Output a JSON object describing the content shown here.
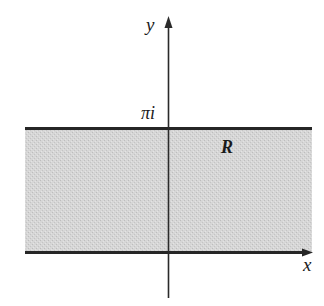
{
  "figure": {
    "type": "complex-plane-region"
  },
  "labels": {
    "y_axis": "y",
    "x_axis": "x",
    "top_boundary": "πi",
    "region": "R"
  },
  "colors": {
    "region_fill": "#d2d2d2",
    "boundary_line": "#262626",
    "axis_line": "#2a2a2a",
    "background": "#ffffff"
  },
  "geometry": {
    "strip": {
      "x_start": 25,
      "x_end": 312,
      "y_top": 128,
      "y_bottom": 252
    },
    "y_axis": {
      "x": 168,
      "y_top": 17,
      "y_bottom": 298
    },
    "x_axis_arrow_tip": {
      "x": 313,
      "y": 252
    }
  }
}
